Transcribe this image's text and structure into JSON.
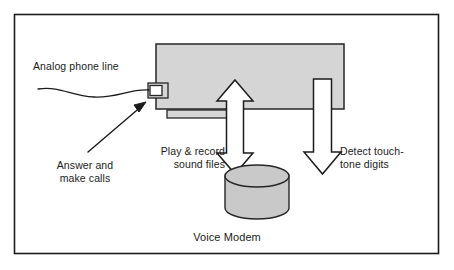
{
  "figure": {
    "caption": "Voice Modem",
    "frame": {
      "stroke": "#1b1b1b"
    },
    "labels": {
      "analog_phone_line": "Analog phone line",
      "answer_and_make_calls": "Answer and\nmake calls",
      "play_and_record": "Play & record\nsound files",
      "detect_touch_tone": "Detect touch-\ntone digits"
    },
    "shapes": {
      "modem_card": {
        "name": "modem-card",
        "fill": "#d5d5d5",
        "stroke": "#262626"
      },
      "phone_jack": {
        "name": "phone-jack",
        "fill": "#ffffff",
        "stroke": "#262626"
      },
      "edge_connector": {
        "name": "edge-connector-strip",
        "fill": "#d5d5d5",
        "stroke": "#262626"
      },
      "sound_file_store": {
        "name": "sound-file-cylinder",
        "fill": "#c9c9c9",
        "stroke": "#262626"
      },
      "arrow_play_record": {
        "name": "double-headed-arrow",
        "direction": "both",
        "fill": "#ffffff",
        "stroke": "#1b1b1b"
      },
      "arrow_touch_tone": {
        "name": "down-arrow",
        "direction": "down",
        "fill": "#ffffff",
        "stroke": "#1b1b1b"
      },
      "phone_line_wire": {
        "name": "analog-line-wire",
        "stroke": "#1b1b1b"
      },
      "pointer_arrow": {
        "name": "callout-pointer-arrow",
        "stroke": "#1b1b1b"
      }
    },
    "colors": {
      "ink": "#1b1b1b",
      "card_gray": "#d5d5d5",
      "cylinder_gray": "#c9c9c9",
      "paper": "#ffffff"
    }
  }
}
